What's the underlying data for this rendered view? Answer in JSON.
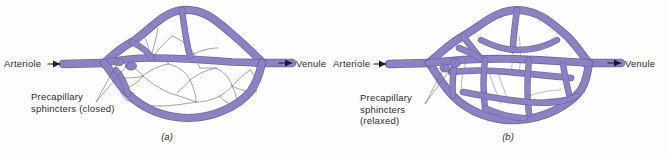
{
  "figure": {
    "background_color": "#fdfdfd",
    "vessel_color": "#8b82c4",
    "vessel_outline_color": "#6f66ab",
    "capillary_color": "#7d7d7d",
    "text_color": "#2b2b2b"
  },
  "panels": [
    {
      "id": "a",
      "caption": "(a)",
      "state": "closed",
      "inlet_label": "Arteriole",
      "outlet_label": "Venule",
      "sphincter_label_lines": [
        "Precapillary",
        "sphincters (closed)"
      ],
      "inlet_arrow": "right-arrow",
      "outlet_arrow": "right-arrow"
    },
    {
      "id": "b",
      "caption": "(b)",
      "state": "relaxed",
      "inlet_label": "Arteriole",
      "outlet_label": "Venule",
      "sphincter_label_lines": [
        "Precapillary",
        "sphincters",
        "(relaxed)"
      ],
      "inlet_arrow": "right-arrow",
      "outlet_arrow": "right-arrow"
    }
  ]
}
